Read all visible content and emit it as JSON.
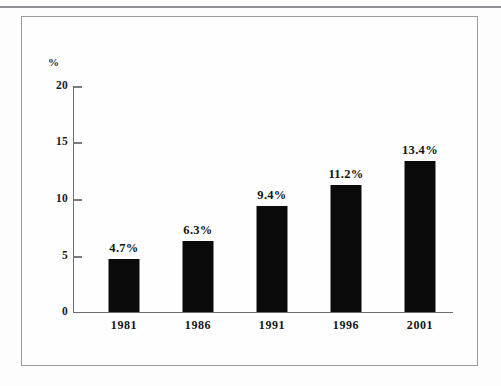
{
  "chart_data": {
    "type": "bar",
    "title": "",
    "xlabel": "",
    "ylabel": "%",
    "unit_label": "%",
    "categories": [
      "1981",
      "1986",
      "1991",
      "1996",
      "2001"
    ],
    "values": [
      4.7,
      6.3,
      9.4,
      11.2,
      13.4
    ],
    "data_labels": [
      "4.7%",
      "6.3%",
      "9.4%",
      "11.2%",
      "13.4%"
    ],
    "ylim": [
      0,
      20
    ],
    "yticks": [
      0,
      5,
      10,
      15,
      20
    ],
    "ytick_labels": [
      "0",
      "5",
      "10",
      "15",
      "20"
    ],
    "grid": false,
    "legend": null,
    "bar_color": "#0b0b0b",
    "axis_color": "#6e6f72",
    "background_color": "#fefefe"
  },
  "figure": {
    "frame_color": "#9a9b9e",
    "rule_color": "#8f9093"
  }
}
